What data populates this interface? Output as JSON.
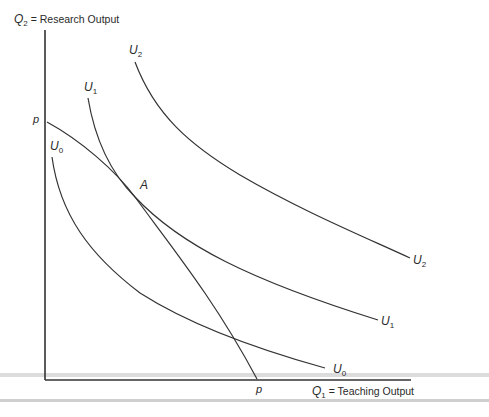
{
  "diagram": {
    "y_axis_label": {
      "var": "Q",
      "sub": "2",
      "text": " = Research Output"
    },
    "x_axis_label": {
      "var": "Q",
      "sub": "1",
      "text": " = Teaching Output"
    },
    "frontier_label_top": "p",
    "frontier_label_bottom": "p",
    "tangency_point_label": "A",
    "curves": [
      {
        "name": "U",
        "sub": "0",
        "label_start": "U0",
        "label_end": "U0"
      },
      {
        "name": "U",
        "sub": "1",
        "label_start": "U1",
        "label_end": "U1"
      },
      {
        "name": "U",
        "sub": "2",
        "label_start": "U2",
        "label_end": "U2"
      }
    ],
    "colors": {
      "line": "#333333",
      "band": "#d6d6d6"
    }
  }
}
